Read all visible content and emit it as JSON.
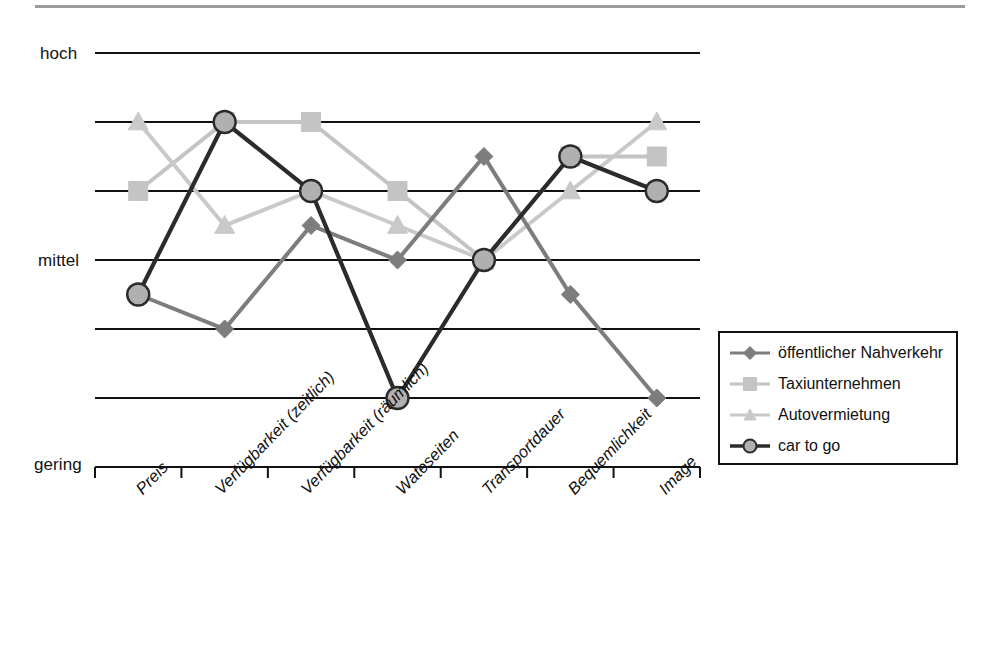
{
  "chart_data": {
    "type": "line",
    "title": "",
    "subtitle": "",
    "xlabel": "",
    "ylabel": "",
    "grid": true,
    "legend_position": "right-bottom",
    "y_axis": {
      "type": "ordinal",
      "tick_labels": [
        "hoch",
        "mittel",
        "gering"
      ],
      "top_label": "hoch",
      "middle_label": "mittel",
      "bottom_label": "gering",
      "scale_min": 0,
      "scale_max": 6,
      "gridline_levels": [
        6,
        5,
        4,
        3,
        2,
        1,
        0
      ]
    },
    "categories": [
      "Preis",
      "Verfügbarkeit (zeitlich)",
      "Verfügbarkeit (räumlich)",
      "Wateseiten",
      "Transportdauer",
      "Bequemlichkeit",
      "Image"
    ],
    "series": [
      {
        "name": "öffentlicher Nahverkehr",
        "marker": "diamond",
        "color": "#7d7d7d",
        "values": [
          2.5,
          2.0,
          3.5,
          3.0,
          4.5,
          2.5,
          1.0
        ]
      },
      {
        "name": "Taxiunternehmen",
        "marker": "square",
        "color": "#c4c4c4",
        "values": [
          4.0,
          5.0,
          5.0,
          4.0,
          3.0,
          4.5,
          4.5
        ]
      },
      {
        "name": "Autovermietung",
        "marker": "triangle",
        "color": "#c9c9c9",
        "values": [
          5.0,
          3.5,
          4.0,
          3.5,
          3.0,
          4.0,
          5.0
        ]
      },
      {
        "name": "car to go",
        "marker": "circle",
        "color": "#4a4a4a",
        "fill": "#b0b0b0",
        "values": [
          2.5,
          5.0,
          4.0,
          1.0,
          3.0,
          4.5,
          4.0
        ]
      }
    ]
  },
  "legend": {
    "items": [
      {
        "label": "öffentlicher Nahverkehr",
        "marker": "diamond",
        "color": "#7d7d7d"
      },
      {
        "label": "Taxiunternehmen",
        "marker": "square",
        "color": "#c4c4c4"
      },
      {
        "label": "Autovermietung",
        "marker": "triangle",
        "color": "#c9c9c9"
      },
      {
        "label": "car to go",
        "marker": "circle",
        "color": "#4a4a4a"
      }
    ]
  },
  "colors": {
    "axis": "#111111",
    "gridline": "#111111",
    "oepnv": "#7d7d7d",
    "taxi": "#c4c4c4",
    "auto": "#c9c9c9",
    "cartogo_stroke": "#2b2b2b",
    "cartogo_fill": "#b0b0b0",
    "background": "#ffffff"
  }
}
